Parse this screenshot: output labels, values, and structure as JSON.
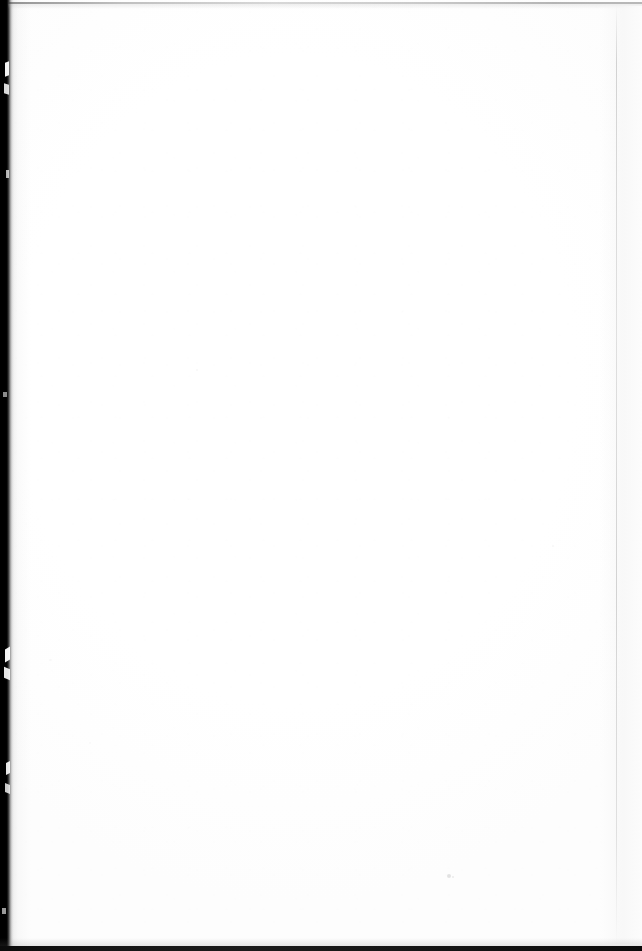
{
  "document": {
    "kind": "scanned-page",
    "page_content_text": "",
    "page_state_label": "This page intentionally left blank",
    "visible_text_count": 0
  },
  "page": {
    "width_px": 642,
    "height_px": 951,
    "paper_color": "#ffffff",
    "paper_tone_color": "#fdfdfd"
  },
  "scan_artifacts": {
    "gutter_shadow": {
      "name": "left-binding-shadow",
      "edge": "left",
      "color": "#000000",
      "width_px": 14
    },
    "top_edge_rule": {
      "name": "top-scan-edge-line",
      "edge": "top",
      "color": "#3c3c3c",
      "y_px": 2
    },
    "bottom_edge_rule": {
      "name": "bottom-scan-edge-line",
      "edge": "bottom",
      "color": "#141414",
      "y_px": 946
    },
    "right_edge_rule": {
      "name": "right-page-edge-line",
      "edge": "right",
      "color": "#b6b6b6",
      "x_px": 616
    },
    "specks": [
      {
        "name": "dust-speck",
        "x_px": 447,
        "y_px": 874,
        "color": "#969696"
      },
      {
        "name": "dust-speck",
        "x_px": 452,
        "y_px": 876,
        "color": "#a0a0a0"
      },
      {
        "name": "dust-speck",
        "x_px": 196,
        "y_px": 369,
        "color": "#c8c8c8"
      },
      {
        "name": "dust-speck",
        "x_px": 552,
        "y_px": 545,
        "color": "#cdcdcd"
      },
      {
        "name": "dust-speck",
        "x_px": 49,
        "y_px": 659,
        "color": "#cdcdcd"
      },
      {
        "name": "dust-speck",
        "x_px": 89,
        "y_px": 742,
        "color": "#d2d2d2"
      }
    ]
  }
}
